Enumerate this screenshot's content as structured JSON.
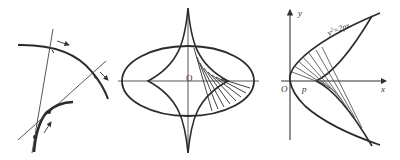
{
  "figure": {
    "panels": [
      {
        "id": "curve-evolute-normals",
        "description": "A curve with two normals and its evolute, arrows showing direction of motion",
        "labels": []
      },
      {
        "id": "ellipse-evolute",
        "description": "Ellipse with its astroid-like evolute and normal chords",
        "labels": {
          "origin": "O"
        }
      },
      {
        "id": "parabola-evolute",
        "description": "Parabola y^2=2px with its semicubical evolute and normals",
        "labels": {
          "y_axis": "y",
          "x_axis": "x",
          "origin": "O",
          "focus_param": "p",
          "equation_base": "y",
          "equation_exp": "2",
          "equation_rest": "=2px"
        }
      }
    ],
    "colors": {
      "stroke": "#2b2b2b",
      "thin_stroke": "#444444",
      "background": "#ffffff"
    }
  }
}
